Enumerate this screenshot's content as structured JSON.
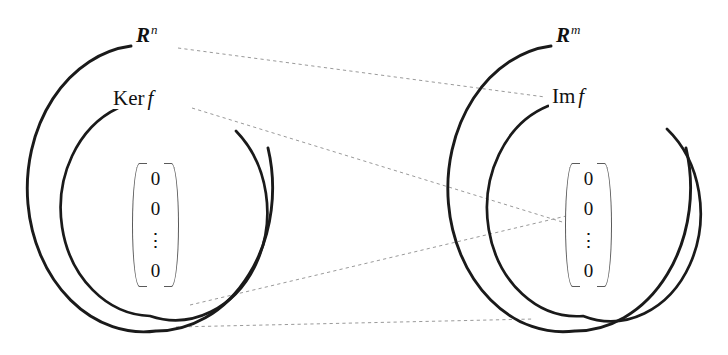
{
  "figure": {
    "background_color": "#ffffff",
    "stroke_color": "#1a1a1a",
    "dashed_color": "#9a9a9a"
  },
  "domain_group": {
    "outer_label": "R",
    "outer_superscript": "n",
    "inner_label_word": "Ker",
    "inner_label_map": "f",
    "zero_vector": {
      "entries": [
        "0",
        "0",
        "0"
      ],
      "ellipsis": "⋮"
    }
  },
  "codomain_group": {
    "outer_label": "R",
    "outer_superscript": "m",
    "inner_label_word": "Im",
    "inner_label_map": "f",
    "zero_vector": {
      "entries": [
        "0",
        "0",
        "0"
      ],
      "ellipsis": "⋮"
    }
  },
  "geometry": {
    "left_outer_ellipse": {
      "cx": 156,
      "cy": 188,
      "rx": 116,
      "ry": 143
    },
    "left_inner_ellipse": {
      "cx": 150,
      "cy": 208,
      "rx": 92,
      "ry": 108
    },
    "right_outer_ellipse": {
      "cx": 575,
      "cy": 188,
      "rx": 115,
      "ry": 143
    },
    "right_inner_ellipse": {
      "cx": 583,
      "cy": 208,
      "rx": 90,
      "ry": 108
    }
  },
  "mapping_lines": [
    {
      "name": "domain-to-image",
      "from": [
        178,
        48
      ],
      "to": [
        545,
        97
      ]
    },
    {
      "name": "kernel-to-zero",
      "from": [
        192,
        108
      ],
      "to": [
        598,
        233
      ]
    },
    {
      "name": "zero-to-zero",
      "from": [
        190,
        305
      ],
      "to": [
        600,
        208
      ]
    },
    {
      "name": "boundary-link",
      "from": [
        176,
        327
      ],
      "to": [
        534,
        319
      ]
    }
  ]
}
